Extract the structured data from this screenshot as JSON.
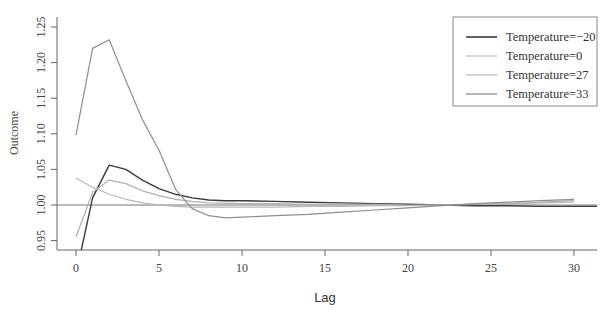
{
  "chart_data": {
    "type": "line",
    "title": "",
    "xlabel": "Lag",
    "ylabel": "Outcome",
    "xlim": [
      -1.1,
      31.3
    ],
    "ylim": [
      0.938,
      1.263
    ],
    "xticks": [
      0,
      5,
      10,
      15,
      20,
      25,
      30
    ],
    "yticks": [
      0.95,
      1.0,
      1.05,
      1.1,
      1.15,
      1.2,
      1.25
    ],
    "ytick_labels": [
      "0.95",
      "1.00",
      "1.05",
      "1.10",
      "1.15",
      "1.20",
      "1.25"
    ],
    "reference_line": 1.0,
    "grid": false,
    "legend_position": "top-right",
    "series": [
      {
        "name": "Temperature=−20",
        "color": "#3a3a3a",
        "x": [
          0.3,
          1,
          2,
          3,
          4,
          5,
          6,
          7,
          8,
          9,
          10,
          12,
          14,
          16,
          18,
          20,
          22,
          24,
          26,
          28,
          30,
          31.5
        ],
        "values": [
          0.935,
          1.01,
          1.056,
          1.05,
          1.035,
          1.023,
          1.015,
          1.01,
          1.007,
          1.006,
          1.006,
          1.005,
          1.004,
          1.003,
          1.002,
          1.001,
          1.0,
          0.999,
          0.999,
          0.998,
          0.998,
          0.998
        ]
      },
      {
        "name": "Temperature=0",
        "color": "#b8b8b8",
        "x": [
          0,
          1,
          2,
          3,
          4,
          5,
          6,
          7,
          8,
          10,
          12,
          14,
          16,
          18,
          20,
          22,
          24,
          26,
          28,
          30
        ],
        "values": [
          1.038,
          1.025,
          1.015,
          1.008,
          1.003,
          1.0,
          0.998,
          0.997,
          0.997,
          0.997,
          0.997,
          0.998,
          0.998,
          0.999,
          0.999,
          1.0,
          1.001,
          1.002,
          1.003,
          1.004
        ]
      },
      {
        "name": "Temperature=27",
        "color": "#b0b0b0",
        "x": [
          0,
          1,
          2,
          3,
          4,
          5,
          6,
          7,
          8,
          10,
          12,
          14,
          16,
          18,
          20,
          22,
          24,
          26,
          28,
          30
        ],
        "values": [
          0.955,
          1.018,
          1.035,
          1.03,
          1.02,
          1.013,
          1.008,
          1.005,
          1.003,
          1.002,
          1.002,
          1.001,
          1.001,
          1.001,
          1.0,
          1.0,
          1.001,
          1.002,
          1.004,
          1.006
        ]
      },
      {
        "name": "Temperature=33",
        "color": "#8e8e8e",
        "x": [
          0,
          1,
          2,
          3,
          4,
          5,
          6,
          7,
          8,
          9,
          10,
          12,
          14,
          16,
          18,
          20,
          22,
          24,
          26,
          28,
          30
        ],
        "values": [
          1.098,
          1.22,
          1.232,
          1.175,
          1.12,
          1.077,
          1.022,
          0.995,
          0.985,
          0.982,
          0.983,
          0.985,
          0.987,
          0.99,
          0.993,
          0.996,
          0.999,
          1.002,
          1.004,
          1.006,
          1.008
        ]
      }
    ]
  },
  "legend": {
    "items": [
      {
        "label": "Temperature=−20",
        "color": "#3a3a3a"
      },
      {
        "label": "Temperature=0",
        "color": "#c4c4c4"
      },
      {
        "label": "Temperature=27",
        "color": "#bcbcbc"
      },
      {
        "label": "Temperature=33",
        "color": "#8e8e8e"
      }
    ]
  },
  "axis": {
    "x_title": "Lag",
    "y_title": "Outcome"
  }
}
